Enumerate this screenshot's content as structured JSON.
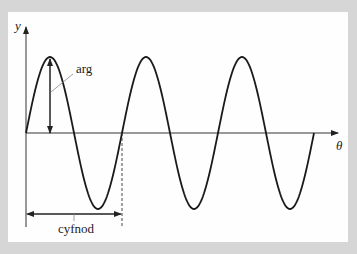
{
  "diagram": {
    "type": "sine-wave",
    "axes": {
      "y_label": "y",
      "x_label": "θ"
    },
    "annotations": {
      "amplitude_label": "arg",
      "period_label": "cyfnod"
    },
    "wave": {
      "cycles": 3,
      "origin_px": [
        26,
        133
      ],
      "period_px": 96,
      "amplitude_px": 76
    },
    "colors": {
      "background": "#d6d6d6",
      "card": "#fefefe",
      "line": "#1a1a1a",
      "axis": "#333333"
    }
  }
}
